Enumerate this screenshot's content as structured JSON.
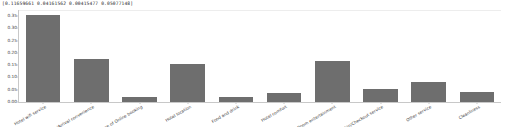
{
  "stdout": {
    "text": "[0.11659661 0.04161562 0.00415477 0.05077148]"
  },
  "chart_data": {
    "type": "bar",
    "title": "",
    "xlabel": "",
    "ylabel": "",
    "ylim": [
      0.0,
      0.375
    ],
    "grid": false,
    "legend": null,
    "bar_color": "#6e6e6e",
    "ytick_labels": [
      "0.35",
      "0.30",
      "0.25",
      "0.20",
      "0.15",
      "0.10",
      "0.05",
      "0.00"
    ],
    "ytick_values": [
      0.35,
      0.3,
      0.25,
      0.2,
      0.15,
      0.1,
      0.05,
      0.0
    ],
    "categories": [
      "Hotel wifi service",
      "Departure/Arrival  convenience",
      "Ease of Online booking",
      "Hotel location",
      "Food and drink",
      "Hotel comfort",
      "Common Room entertainment",
      "Checkin/Checkout service",
      "Other service",
      "Cleanliness"
    ],
    "values": [
      0.355,
      0.175,
      0.022,
      0.153,
      0.021,
      0.038,
      0.168,
      0.054,
      0.082,
      0.039
    ]
  }
}
